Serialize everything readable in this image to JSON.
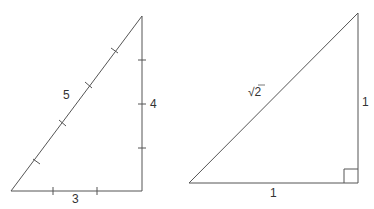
{
  "diagram": {
    "stroke_color": "#555555",
    "triangles": [
      {
        "name": "3-4-5 right triangle",
        "labels": {
          "hypotenuse": "5",
          "vertical": "4",
          "base": "3"
        },
        "tick_marks": {
          "base": 2,
          "vertical": 3,
          "hypotenuse": 4
        }
      },
      {
        "name": "isosceles right triangle",
        "labels": {
          "hypotenuse": "√2",
          "vertical": "1",
          "base": "1"
        },
        "right_angle_marker": true
      }
    ]
  }
}
